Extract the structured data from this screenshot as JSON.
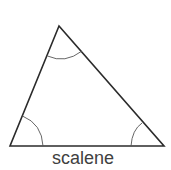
{
  "diagram": {
    "type": "triangle",
    "label": "scalene",
    "vertices": {
      "top": [
        59,
        26
      ],
      "bottom_left": [
        10,
        146
      ],
      "bottom_right": [
        164,
        146
      ]
    },
    "angle_marks": [
      "top",
      "bottom_left",
      "bottom_right"
    ],
    "colors": {
      "stroke": "#2b2b2b",
      "arc": "#555555",
      "label": "#404040",
      "background": "#ffffff"
    }
  }
}
